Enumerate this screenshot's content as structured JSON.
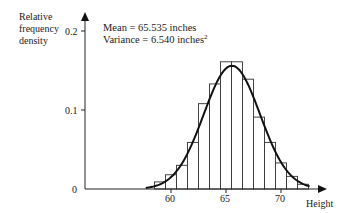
{
  "chart_data": {
    "type": "bar",
    "subtype": "histogram_with_normal_curve",
    "title": "",
    "xlabel": "Height",
    "ylabel": "Relative frequency density",
    "ylabel_lines": [
      "Relative",
      "frequency",
      "density"
    ],
    "annotations": {
      "mean_text": "Mean = 65.535 inches",
      "variance_text_prefix": "Variance = 6.540 inches",
      "variance_exponent": "2"
    },
    "x_ticks": [
      60,
      65,
      70
    ],
    "x_tick_labels": [
      "60",
      "65",
      "70"
    ],
    "y_ticks": [
      0,
      0.1,
      0.2
    ],
    "y_tick_labels": [
      "0",
      "0.1",
      "0.2"
    ],
    "ylim": [
      0,
      0.22
    ],
    "xlim": [
      57,
      73
    ],
    "grid": false,
    "legend": null,
    "bin_width": 1,
    "categories": [
      59,
      60,
      61,
      62,
      63,
      64,
      65,
      66,
      67,
      68,
      69,
      70,
      71,
      72
    ],
    "values": [
      0.009,
      0.018,
      0.03,
      0.059,
      0.108,
      0.133,
      0.161,
      0.161,
      0.139,
      0.091,
      0.059,
      0.033,
      0.016,
      0.006
    ],
    "curve": {
      "type": "normal",
      "mean": 65.535,
      "variance": 6.54,
      "x_range": [
        57.7,
        72.6
      ]
    }
  }
}
